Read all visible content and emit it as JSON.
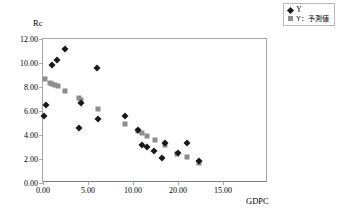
{
  "legend": {
    "position": "top-right",
    "entries": [
      {
        "label": "Y",
        "marker": "diamond-marker",
        "color": "#1a1a1a",
        "jp": false
      },
      {
        "label": "Y：予測値",
        "marker": "square-marker",
        "color": "#8d8d8d",
        "jp": true
      }
    ]
  },
  "chart_data": {
    "type": "scatter",
    "title": "",
    "xlabel": "GDPC",
    "ylabel": "Rc",
    "xlim": [
      0,
      25
    ],
    "ylim": [
      0,
      12
    ],
    "grid": false,
    "legend_position": "top-right",
    "ytick_labels": [
      "0.00",
      "2.00",
      "4.00",
      "6.00",
      "8.00",
      "10.00",
      "12.00"
    ],
    "ytick_values": [
      0,
      2,
      4,
      6,
      8,
      10,
      12
    ],
    "xtick_labels": [
      "0.00",
      "5.00",
      "10.00",
      "20.00",
      "15.00"
    ],
    "xtick_values": [
      0,
      5,
      10,
      15,
      20
    ],
    "series": [
      {
        "name": "Y",
        "marker": "diamond",
        "color": "#1a1a1a",
        "points": [
          [
            0.15,
            5.55
          ],
          [
            0.3,
            6.5
          ],
          [
            1.05,
            9.8
          ],
          [
            1.6,
            10.25
          ],
          [
            2.45,
            11.15
          ],
          [
            3.95,
            4.6
          ],
          [
            4.25,
            6.65
          ],
          [
            6.05,
            9.55
          ],
          [
            6.1,
            5.35
          ],
          [
            9.1,
            5.6
          ],
          [
            10.6,
            4.4
          ],
          [
            11.0,
            3.2
          ],
          [
            11.55,
            2.98
          ],
          [
            12.35,
            2.65
          ],
          [
            13.25,
            2.05
          ],
          [
            13.6,
            3.3
          ],
          [
            14.95,
            2.5
          ],
          [
            15.95,
            3.35
          ],
          [
            17.35,
            1.85
          ]
        ]
      },
      {
        "name": "Y：予測値",
        "marker": "square",
        "color": "#8d8d8d",
        "points": [
          [
            0.2,
            8.7
          ],
          [
            0.75,
            8.3
          ],
          [
            1.05,
            8.25
          ],
          [
            1.35,
            8.2
          ],
          [
            1.65,
            8.05
          ],
          [
            2.45,
            7.7
          ],
          [
            4.05,
            7.1
          ],
          [
            4.2,
            6.95
          ],
          [
            6.1,
            6.2
          ],
          [
            9.1,
            4.95
          ],
          [
            10.6,
            4.3
          ],
          [
            11.05,
            4.2
          ],
          [
            11.6,
            3.95
          ],
          [
            12.4,
            3.55
          ],
          [
            13.55,
            3.2
          ],
          [
            14.9,
            2.45
          ],
          [
            15.95,
            2.15
          ],
          [
            17.35,
            1.7
          ]
        ]
      }
    ]
  }
}
